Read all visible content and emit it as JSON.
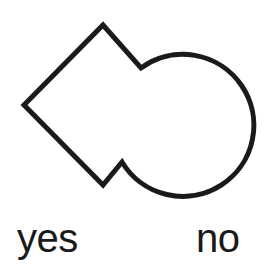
{
  "figure": {
    "background_color": "#ffffff",
    "stroke_color": "#1a1a1a",
    "stroke_width": 5,
    "shape": {
      "name": "union-of-diamond-and-circle",
      "description": "outline of a leftward-pointing diamond fused with a circle on its right",
      "parts": [
        {
          "kind": "diamond",
          "points": "103,25 182,105 103,185 24,105"
        },
        {
          "kind": "circle",
          "cx": 181,
          "cy": 127,
          "r": 71
        }
      ],
      "notch_vertices": [
        {
          "label": "upper-notch",
          "x": 141,
          "y": 68
        },
        {
          "label": "lower-notch",
          "x": 122,
          "y": 162
        }
      ],
      "outline_path": "M 103 25 L 141 68 A 71 71 0 1 1 122 162 L 103 185 L 24 105 Z"
    }
  },
  "labels": {
    "yes": "yes",
    "no": "no"
  }
}
